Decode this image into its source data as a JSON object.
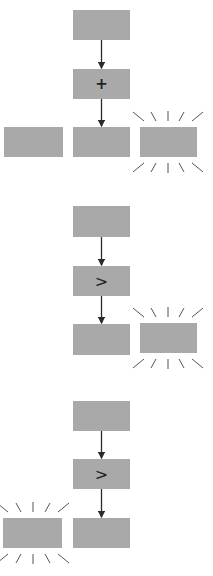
{
  "colors": {
    "box_fill": "#a9a9a9",
    "arrow": "#2a2a2a",
    "rays": "#555555",
    "background": "#ffffff"
  },
  "groups": [
    {
      "name": "group-add",
      "operator": "+",
      "boxes": [
        {
          "id": "input",
          "x": 73,
          "y": 10,
          "w": 57,
          "h": 30,
          "label": ""
        },
        {
          "id": "operator",
          "x": 73,
          "y": 69,
          "w": 57,
          "h": 30,
          "label": "+"
        },
        {
          "id": "option-left",
          "x": 4,
          "y": 127,
          "w": 59,
          "h": 30,
          "label": ""
        },
        {
          "id": "option-middle",
          "x": 73,
          "y": 127,
          "w": 57,
          "h": 30,
          "label": ""
        },
        {
          "id": "option-right",
          "x": 140,
          "y": 127,
          "w": 57,
          "h": 30,
          "label": "",
          "highlighted": true
        }
      ]
    },
    {
      "name": "group-greater-1",
      "operator": ">",
      "boxes": [
        {
          "id": "input",
          "x": 73,
          "y": 206,
          "w": 57,
          "h": 31,
          "label": ""
        },
        {
          "id": "operator",
          "x": 73,
          "y": 266,
          "w": 57,
          "h": 30,
          "label": ">"
        },
        {
          "id": "option-middle",
          "x": 73,
          "y": 324,
          "w": 57,
          "h": 31,
          "label": ""
        },
        {
          "id": "option-right",
          "x": 140,
          "y": 323,
          "w": 57,
          "h": 30,
          "label": "",
          "highlighted": true
        }
      ]
    },
    {
      "name": "group-greater-2",
      "operator": ">",
      "boxes": [
        {
          "id": "input",
          "x": 73,
          "y": 401,
          "w": 57,
          "h": 30,
          "label": ""
        },
        {
          "id": "operator",
          "x": 73,
          "y": 459,
          "w": 57,
          "h": 30,
          "label": ">"
        },
        {
          "id": "option-left",
          "x": 3,
          "y": 518,
          "w": 59,
          "h": 30,
          "label": "",
          "highlighted": true
        },
        {
          "id": "option-middle",
          "x": 73,
          "y": 518,
          "w": 57,
          "h": 30,
          "label": ""
        }
      ]
    }
  ],
  "labels": {
    "op_add": "+",
    "op_gt_1": ">",
    "op_gt_2": ">"
  }
}
